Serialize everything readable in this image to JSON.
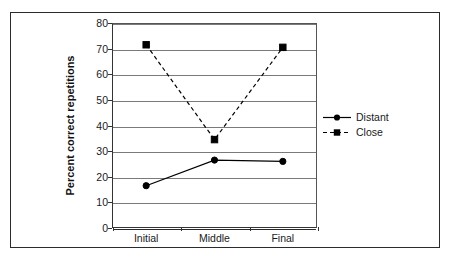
{
  "chart_data": {
    "type": "line",
    "title": "",
    "xlabel": "",
    "ylabel": "Percent correct repetitions",
    "categories": [
      "Initial",
      "Middle",
      "Final"
    ],
    "ylim": [
      0,
      80
    ],
    "yticks": [
      0,
      10,
      20,
      30,
      40,
      50,
      60,
      70,
      80
    ],
    "ytick_labels": [
      "0",
      "10",
      "20",
      "30",
      "40",
      "50",
      "60",
      "70",
      "80"
    ],
    "grid": "horizontal",
    "legend_position": "right",
    "series": [
      {
        "name": "Distant",
        "values": [
          16.5,
          26.5,
          26
        ],
        "line_style": "solid",
        "marker": "circle",
        "color": "#000000"
      },
      {
        "name": "Close",
        "values": [
          71.5,
          34.5,
          70.5
        ],
        "line_style": "dashed",
        "marker": "square",
        "color": "#000000"
      }
    ]
  },
  "legend": {
    "items": [
      {
        "label": "Distant",
        "marker": "circle-marker",
        "line_style": "solid"
      },
      {
        "label": "Close",
        "marker": "square-marker",
        "line_style": "dashed"
      }
    ]
  },
  "colors": {
    "frame": "#2b2b2b",
    "gridline": "#7a7a7a",
    "axis": "#333333",
    "series": "#000000",
    "background": "#ffffff"
  }
}
